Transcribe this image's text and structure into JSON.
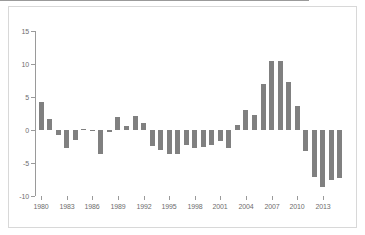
{
  "chart": {
    "title": "",
    "subtitle": "",
    "xlabel": "",
    "ylabel": "",
    "bar_color": "#808080",
    "axis_color": "#9a9a9a",
    "frame_color": "#d8d8d8",
    "background": "#ffffff"
  },
  "chart_data": {
    "type": "bar",
    "title": "",
    "xlabel": "",
    "ylabel": "",
    "ylim": [
      -10,
      15
    ],
    "xlim": [
      1979.4,
      2015.6
    ],
    "grid": false,
    "legend": null,
    "ytick_labels": [
      "15",
      "10",
      "5",
      "0",
      "-5",
      "-10"
    ],
    "ytick_values": [
      15,
      10,
      5,
      0,
      -5,
      -10
    ],
    "xtick_labels": [
      "1980",
      "1983",
      "1986",
      "1989",
      "1992",
      "1995",
      "1998",
      "2001",
      "2004",
      "2007",
      "2010",
      "2013"
    ],
    "xtick_values": [
      1980,
      1983,
      1986,
      1989,
      1992,
      1995,
      1998,
      2001,
      2004,
      2007,
      2010,
      2013
    ],
    "categories": [
      1980,
      1981,
      1982,
      1983,
      1984,
      1985,
      1986,
      1987,
      1988,
      1989,
      1990,
      1991,
      1992,
      1993,
      1994,
      1995,
      1996,
      1997,
      1998,
      1999,
      2000,
      2001,
      2002,
      2003,
      2004,
      2005,
      2006,
      2007,
      2008,
      2009,
      2010,
      2011,
      2012,
      2013,
      2014,
      2015
    ],
    "values": [
      4.3,
      1.7,
      -0.7,
      -2.8,
      -1.5,
      0.1,
      -0.2,
      -3.6,
      -0.3,
      2.0,
      0.6,
      2.1,
      1.0,
      -2.4,
      -3.0,
      -3.6,
      -3.6,
      -2.3,
      -2.8,
      -2.6,
      -2.3,
      -1.7,
      -2.8,
      0.7,
      3.1,
      2.2,
      6.9,
      10.4,
      10.5,
      7.3,
      3.6,
      -3.2,
      -7.1,
      -8.7,
      -7.5,
      -7.3
    ]
  }
}
